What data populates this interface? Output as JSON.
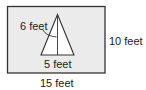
{
  "figure": {
    "type": "geometry-diagram",
    "colors": {
      "rectangle_fill": "#ebebeb",
      "stroke": "#333333",
      "triangle_fill": "#ffffff",
      "text": "#222222"
    }
  },
  "rectangle": {
    "width_label": "15 feet",
    "height_label": "10 feet"
  },
  "triangle": {
    "base_label": "5 feet",
    "height_label": "6 feet"
  }
}
